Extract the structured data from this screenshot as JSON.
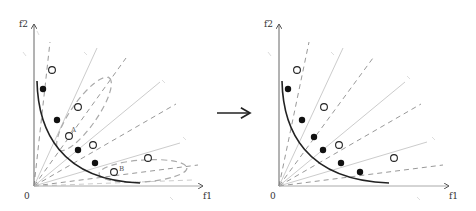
{
  "figure": {
    "arrow_color": "#222222",
    "colors": {
      "axis": "#555555",
      "front_curve": "#222222",
      "solid_ray": "#cccccc",
      "dashed_ray": "#999999",
      "ellipse": "#aaaaaa",
      "filled_point": "#111111",
      "open_point_stroke": "#222222"
    },
    "left_panel": {
      "origin_label": "0",
      "x_axis_label": "f1",
      "y_axis_label": "f2",
      "point_labels": {
        "A": "A",
        "B": "B"
      },
      "origin": [
        34,
        186
      ],
      "x_axis_end": [
        203,
        186
      ],
      "y_axis_end": [
        34,
        24
      ],
      "open_points": [
        [
          52,
          70
        ],
        [
          78,
          107
        ],
        [
          69,
          136
        ],
        [
          93,
          145
        ],
        [
          148,
          158
        ],
        [
          114,
          172
        ]
      ],
      "filled_points": [
        [
          43,
          89
        ],
        [
          57,
          120
        ],
        [
          78,
          150
        ],
        [
          95,
          163
        ]
      ],
      "solid_rays": [
        [
          72,
          48
        ],
        [
          100,
          48
        ],
        [
          160,
          82
        ],
        [
          178,
          140
        ]
      ],
      "dashed_rays": [
        [
          50,
          42
        ],
        [
          126,
          58
        ],
        [
          176,
          104
        ],
        [
          198,
          165
        ],
        [
          190,
          180
        ]
      ],
      "ellipses": [
        {
          "cx": 84,
          "cy": 114,
          "rx": 42,
          "ry": 14,
          "rot": -55
        },
        {
          "cx": 142,
          "cy": 172,
          "rx": 44,
          "ry": 12,
          "rot": -3
        }
      ]
    },
    "right_panel": {
      "origin_label": "0",
      "x_axis_label": "f1",
      "y_axis_label": "f2",
      "origin": [
        279,
        186
      ],
      "x_axis_end": [
        449,
        186
      ],
      "y_axis_end": [
        279,
        24
      ],
      "open_points": [
        [
          297,
          70
        ],
        [
          324,
          107
        ],
        [
          339,
          145
        ],
        [
          394,
          158
        ]
      ],
      "filled_points": [
        [
          288,
          89
        ],
        [
          302,
          120
        ],
        [
          314,
          137
        ],
        [
          323,
          150
        ],
        [
          341,
          163
        ],
        [
          360,
          172
        ]
      ],
      "solid_rays": [
        [
          343,
          48
        ],
        [
          405,
          82
        ],
        [
          427,
          140
        ]
      ],
      "dashed_rays": [
        [
          309,
          42
        ],
        [
          373,
          58
        ],
        [
          421,
          104
        ],
        [
          443,
          165
        ]
      ]
    }
  }
}
